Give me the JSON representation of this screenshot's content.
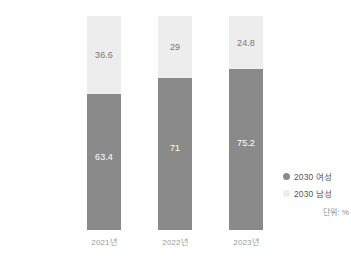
{
  "chart_data": {
    "type": "bar",
    "subtype": "stacked-100-percent",
    "title": "",
    "subtitle": "",
    "xlabel": "",
    "ylabel": "",
    "unit_note": "단위: %",
    "grid": false,
    "legend_position": "right",
    "ylim": [
      0,
      100
    ],
    "categories": [
      "2021년",
      "2022년",
      "2023년"
    ],
    "series": [
      {
        "name": "2030 남성",
        "color": "#ededed",
        "values": [
          36.6,
          29,
          24.8
        ],
        "labels": [
          "36.6",
          "29",
          "24.8"
        ]
      },
      {
        "name": "2030 여성",
        "color": "#8a8a8a",
        "values": [
          63.4,
          71,
          75.2
        ],
        "labels": [
          "63.4",
          "71",
          "75.2"
        ]
      }
    ],
    "legend": [
      {
        "label": "2030 여성",
        "color": "#8a8a8a"
      },
      {
        "label": "2030 남성",
        "color": "#ededed"
      }
    ]
  }
}
